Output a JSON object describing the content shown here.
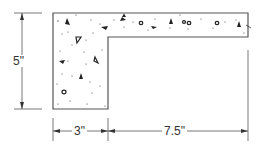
{
  "diagram": {
    "dimensions": {
      "height": "5\"",
      "stem_width": "3\"",
      "flange_extension": "7.5\""
    },
    "colors": {
      "line": "#555555",
      "fill": "#ffffff",
      "text": "#333333"
    }
  }
}
